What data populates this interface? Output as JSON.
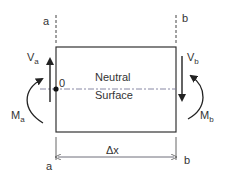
{
  "diagram": {
    "type": "beam-element-free-body",
    "section_labels": {
      "left_top": "a",
      "right_top": "b",
      "left_bottom": "a",
      "right_bottom": "b"
    },
    "origin_label": "0",
    "neutral_surface": {
      "line1": "Neutral",
      "line2": "Surface"
    },
    "shear_forces": {
      "left": {
        "symbol": "V",
        "subscript": "a",
        "direction": "up"
      },
      "right": {
        "symbol": "V",
        "subscript": "b",
        "direction": "down"
      }
    },
    "moments": {
      "left": {
        "symbol": "M",
        "subscript": "a",
        "direction": "clockwise"
      },
      "right": {
        "symbol": "M",
        "subscript": "b",
        "direction": "counterclockwise"
      }
    },
    "dimension": {
      "label": "Δx"
    },
    "colors": {
      "line": "#333333",
      "background": "#ffffff",
      "dashed_axis": "#7a7a9a"
    }
  }
}
